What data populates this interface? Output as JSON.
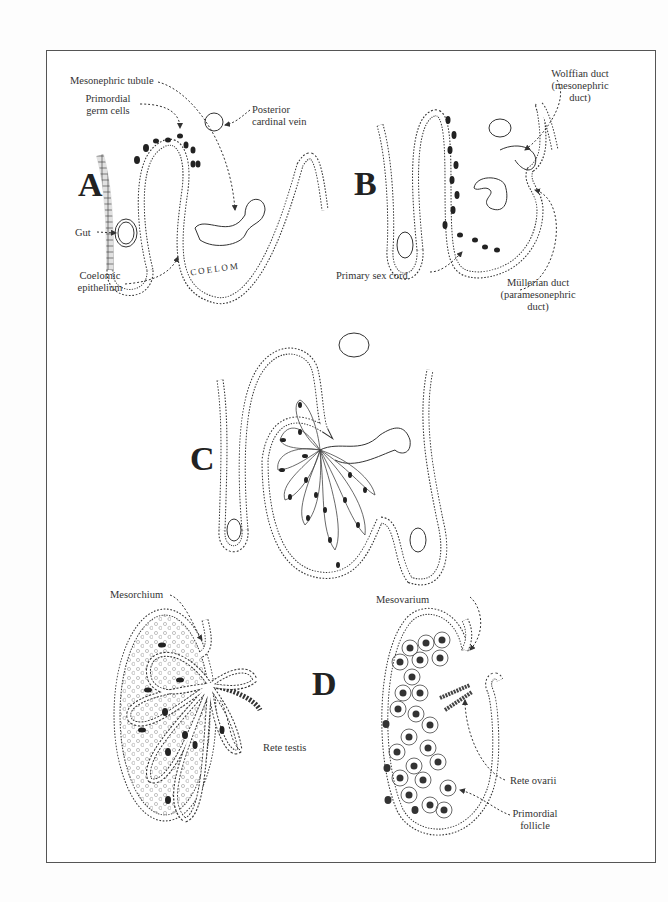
{
  "figure": {
    "panels": [
      {
        "id": "A",
        "label": "A"
      },
      {
        "id": "B",
        "label": "B"
      },
      {
        "id": "C",
        "label": "C"
      },
      {
        "id": "D",
        "label": "D"
      }
    ],
    "labels": {
      "mesonephric_tubule": "Mesonephric tubule",
      "primordial_germ_cells_1": "Primordial",
      "primordial_germ_cells_2": "germ cells",
      "posterior_cardinal_vein_1": "Posterior",
      "posterior_cardinal_vein_2": "cardinal vein",
      "gut": "Gut",
      "coelomic_epithelium_1": "Coelomic",
      "coelomic_epithelium_2": "epithelium",
      "coelom": "COELOM",
      "wolffian_duct_1": "Wolffian duct",
      "wolffian_duct_2": "(mesonephric",
      "wolffian_duct_3": "duct)",
      "primary_sex_cord": "Primary sex cord",
      "mullerian_duct_1": "Müllerian duct",
      "mullerian_duct_2": "(paramesonephric",
      "mullerian_duct_3": "duct)",
      "mesorchium": "Mesorchium",
      "rete_testis": "Rete testis",
      "mesovarium": "Mesovarium",
      "rete_ovarii": "Rete ovarii",
      "primordial_follicle_1": "Primordial",
      "primordial_follicle_2": "follicle"
    }
  }
}
